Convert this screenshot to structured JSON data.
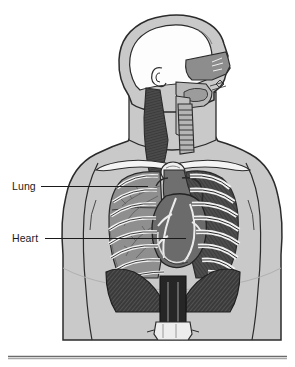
{
  "figure": {
    "background_color": "#ffffff",
    "labels": [
      {
        "id": "lung",
        "text": "Lung",
        "text_x": 12,
        "text_y": 190,
        "leader_x1": 41,
        "leader_x2": 148,
        "leader_y": 186
      },
      {
        "id": "heart",
        "text": "Heart",
        "text_x": 12,
        "text_y": 242,
        "leader_x1": 45,
        "leader_x2": 186,
        "leader_y": 238
      }
    ],
    "divider": {
      "name": "bottom-rule",
      "x1": 8,
      "x2": 287,
      "y": 357
    },
    "palette": {
      "body_fill": "#c9c9c9",
      "body_outline": "#2b2b2b",
      "skull_cavity": "#fdfdfd",
      "lung_fill": "#8f8f8f",
      "lung_shadow": "#7a7a7a",
      "heart_fill": "#6b6b6b",
      "heart_highlight": "#e8e8e8",
      "rib_fill": "#f2f2f2",
      "rib_outline": "#2b2b2b",
      "clavicle_fill": "#f4f4f4",
      "trachea_fill": "#b5b5b5",
      "muscle_dark": "#4a4a4a",
      "diaphragm_fill": "#3d3d3d",
      "cavity_dark": "#2a2a2a",
      "nasal_fill": "#9a9a9a",
      "label_color": "#1a1a1a",
      "rule_color": "#6b6b6b"
    },
    "anatomy_parts": [
      "head-outline",
      "skull-cavity",
      "ear",
      "nasal-cavity",
      "tongue",
      "pharynx",
      "neck-muscle",
      "trachea",
      "clavicle-left",
      "clavicle-right",
      "sternum",
      "rib-cage-left",
      "rib-cage-right",
      "lung-left",
      "lung-right",
      "bronchial-tree",
      "heart",
      "coronary-vessels",
      "aorta",
      "diaphragm",
      "esophagus",
      "stomach",
      "torso-outline",
      "shoulder-left",
      "shoulder-right",
      "arm-left",
      "arm-right"
    ]
  }
}
